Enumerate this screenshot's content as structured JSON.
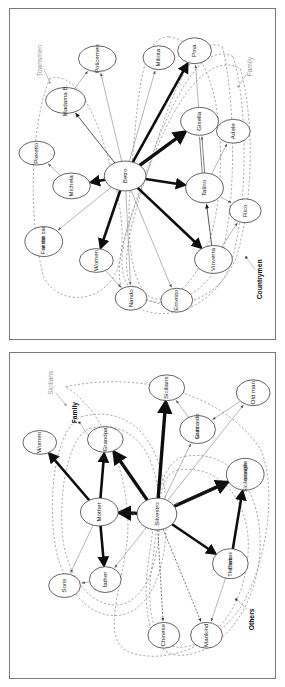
{
  "figure": {
    "panels": [
      {
        "id": "panel-top",
        "name": "La bella estate network",
        "group_labels": [
          {
            "text": "Townsmen",
            "style": "grey",
            "x": 30,
            "y": 52,
            "rot": -90
          },
          {
            "text": "Family",
            "style": "grey",
            "x": 242,
            "y": 58,
            "rot": -90
          },
          {
            "text": "Countrymen",
            "style": "bold",
            "x": 252,
            "y": 272,
            "rot": -90
          }
        ],
        "nodes": [
          {
            "id": "betro",
            "label": "Betro",
            "x": 116,
            "y": 168,
            "rx": 21,
            "ry": 15
          },
          {
            "id": "michela",
            "label": "Michela",
            "x": 62,
            "y": 178,
            "rx": 19,
            "ry": 13
          },
          {
            "id": "pieretto",
            "label": "Pieretto",
            "x": 27,
            "y": 145,
            "rx": 18,
            "ry": 12
          },
          {
            "id": "madama",
            "label": "Madama B.",
            "x": 56,
            "y": 92,
            "rx": 20,
            "ry": 13
          },
          {
            "id": "policemen",
            "label": "Policemen",
            "x": 88,
            "y": 50,
            "rx": 19,
            "ry": 13
          },
          {
            "id": "friends",
            "label": "Friends\nat the bar",
            "x": 34,
            "y": 234,
            "rx": 19,
            "ry": 15
          },
          {
            "id": "women",
            "label": "Women",
            "x": 87,
            "y": 253,
            "rx": 17,
            "ry": 12
          },
          {
            "id": "nando",
            "label": "Nando",
            "x": 122,
            "y": 291,
            "rx": 16,
            "ry": 12
          },
          {
            "id": "ernesto",
            "label": "Ernesto",
            "x": 168,
            "y": 293,
            "rx": 16,
            "ry": 12
          },
          {
            "id": "miliota",
            "label": "Miliota",
            "x": 150,
            "y": 49,
            "rx": 16,
            "ry": 12
          },
          {
            "id": "pina",
            "label": "Pina",
            "x": 186,
            "y": 42,
            "rx": 17,
            "ry": 13
          },
          {
            "id": "gisella",
            "label": "Gisella",
            "x": 191,
            "y": 113,
            "rx": 19,
            "ry": 14
          },
          {
            "id": "adele",
            "label": "Adele",
            "x": 225,
            "y": 123,
            "rx": 17,
            "ry": 12
          },
          {
            "id": "talino",
            "label": "Talino",
            "x": 196,
            "y": 180,
            "rx": 19,
            "ry": 15
          },
          {
            "id": "rico",
            "label": "Rico",
            "x": 237,
            "y": 203,
            "rx": 16,
            "ry": 12
          },
          {
            "id": "vinverra",
            "label": "Vinverra",
            "x": 205,
            "y": 252,
            "rx": 19,
            "ry": 14
          }
        ],
        "edges": [
          {
            "from": "betro",
            "to": "michela",
            "weight": "thick"
          },
          {
            "from": "betro",
            "to": "gisella",
            "weight": "xthick"
          },
          {
            "from": "betro",
            "to": "pina",
            "weight": "thick"
          },
          {
            "from": "betro",
            "to": "talino",
            "weight": "thick"
          },
          {
            "from": "betro",
            "to": "vinverra",
            "weight": "thick"
          },
          {
            "from": "betro",
            "to": "women",
            "weight": "thick"
          },
          {
            "from": "betro",
            "to": "nando",
            "weight": "thin"
          },
          {
            "from": "betro",
            "to": "ernesto",
            "weight": "thin"
          },
          {
            "from": "betro",
            "to": "miliota",
            "weight": "thin"
          },
          {
            "from": "betro",
            "to": "policemen",
            "weight": "thin"
          },
          {
            "from": "betro",
            "to": "friends",
            "weight": "thin"
          },
          {
            "from": "betro",
            "to": "madama",
            "weight": "mid"
          },
          {
            "from": "michela",
            "to": "pieretto",
            "weight": "thin"
          },
          {
            "from": "madama",
            "to": "policemen",
            "weight": "thin"
          },
          {
            "from": "talino",
            "to": "gisella",
            "weight": "double"
          },
          {
            "from": "talino",
            "to": "adele",
            "weight": "thin"
          },
          {
            "from": "talino",
            "to": "rico",
            "weight": "thin"
          },
          {
            "from": "vinverra",
            "to": "talino",
            "weight": "mid"
          },
          {
            "from": "gisella",
            "to": "pina",
            "weight": "thin"
          },
          {
            "from": "women",
            "to": "nando",
            "weight": "thin"
          },
          {
            "from": "vinverra",
            "to": "rico",
            "weight": "thin"
          }
        ]
      },
      {
        "id": "panel-bottom",
        "name": "Conversazione in Sicilia network",
        "group_labels": [
          {
            "text": "Sicilians",
            "style": "grey",
            "x": 42,
            "y": 30,
            "rot": -90
          },
          {
            "text": "Family",
            "style": "bold",
            "x": 66,
            "y": 60,
            "rot": -90
          },
          {
            "text": "Others",
            "style": "bold",
            "x": 244,
            "y": 268,
            "rot": -90
          }
        ],
        "nodes": [
          {
            "id": "silvestro",
            "label": "Silvestro",
            "x": 148,
            "y": 162,
            "rx": 20,
            "ry": 16
          },
          {
            "id": "mother",
            "label": "Mother",
            "x": 90,
            "y": 160,
            "rx": 19,
            "ry": 14
          },
          {
            "id": "grandpa",
            "label": "Grandpa",
            "x": 96,
            "y": 87,
            "rx": 18,
            "ry": 13
          },
          {
            "id": "women2",
            "label": "Women",
            "x": 30,
            "y": 90,
            "rx": 17,
            "ry": 12
          },
          {
            "id": "father",
            "label": "father",
            "x": 96,
            "y": 228,
            "rx": 16,
            "ry": 13
          },
          {
            "id": "sons",
            "label": "Sons",
            "x": 55,
            "y": 234,
            "rx": 16,
            "ry": 12
          },
          {
            "id": "sicilians2",
            "label": "Sicilians",
            "x": 158,
            "y": 35,
            "rx": 18,
            "ry": 13
          },
          {
            "id": "granlomb",
            "label": "Gran\nLombardo",
            "x": 189,
            "y": 77,
            "rx": 18,
            "ry": 14
          },
          {
            "id": "oldman",
            "label": "Old man",
            "x": 245,
            "y": 40,
            "rx": 17,
            "ry": 13
          },
          {
            "id": "sicorange",
            "label": "Sicilian with\noranges",
            "x": 237,
            "y": 122,
            "rx": 19,
            "ry": 16
          },
          {
            "id": "bartoni",
            "label": "The two\nBartoni",
            "x": 222,
            "y": 212,
            "rx": 18,
            "ry": 15
          },
          {
            "id": "chinese",
            "label": "Chinese",
            "x": 155,
            "y": 284,
            "rx": 16,
            "ry": 13
          },
          {
            "id": "mankind",
            "label": "Mankind",
            "x": 198,
            "y": 284,
            "rx": 16,
            "ry": 13
          }
        ],
        "edges": [
          {
            "from": "silvestro",
            "to": "grandpa",
            "weight": "xthick"
          },
          {
            "from": "silvestro",
            "to": "mother",
            "weight": "xthick"
          },
          {
            "from": "silvestro",
            "to": "sicilians2",
            "weight": "xthick"
          },
          {
            "from": "silvestro",
            "to": "sicorange",
            "weight": "xthick"
          },
          {
            "from": "silvestro",
            "to": "bartoni",
            "weight": "thick"
          },
          {
            "from": "silvestro",
            "to": "father",
            "weight": "thin"
          },
          {
            "from": "silvestro",
            "to": "granlomb",
            "weight": "thin"
          },
          {
            "from": "silvestro",
            "to": "oldman",
            "weight": "thin"
          },
          {
            "from": "silvestro",
            "to": "chinese",
            "weight": "dash"
          },
          {
            "from": "silvestro",
            "to": "mankind",
            "weight": "dash"
          },
          {
            "from": "mother",
            "to": "women2",
            "weight": "thick"
          },
          {
            "from": "mother",
            "to": "grandpa",
            "weight": "thick"
          },
          {
            "from": "mother",
            "to": "father",
            "weight": "thick"
          },
          {
            "from": "mother",
            "to": "sons",
            "weight": "thin"
          },
          {
            "from": "mother",
            "to": "silvestro",
            "weight": "double"
          },
          {
            "from": "father",
            "to": "sons",
            "weight": "thin"
          },
          {
            "from": "granlomb",
            "to": "sicilians2",
            "weight": "thin"
          },
          {
            "from": "oldman",
            "to": "granlomb",
            "weight": "thin"
          },
          {
            "from": "bartoni",
            "to": "sicorange",
            "weight": "thick"
          },
          {
            "from": "bartoni",
            "to": "mankind",
            "weight": "thin"
          },
          {
            "from": "sicorange",
            "to": "silvestro",
            "weight": "double"
          }
        ]
      }
    ]
  }
}
